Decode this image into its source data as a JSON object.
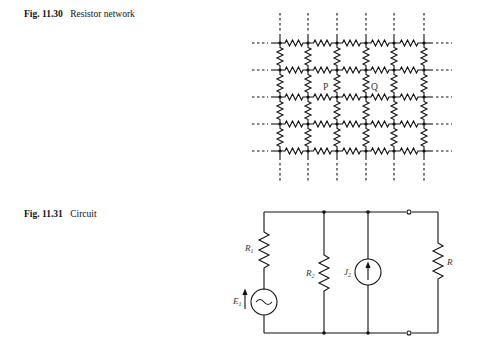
{
  "figures": [
    {
      "number": "Fig. 11.30",
      "title": "Resistor network",
      "labels": {
        "p": "P",
        "q": "Q"
      },
      "grid": {
        "columns_x": [
          280,
          308,
          337,
          366,
          394,
          424
        ],
        "rows_y": [
          43,
          70,
          97,
          124,
          151
        ]
      }
    },
    {
      "number": "Fig. 11.31",
      "title": "Circuit",
      "labels": {
        "r1": "R",
        "r1_sub": "1",
        "r2": "R",
        "r2_sub": "2",
        "j2": "J",
        "j2_sub": "2",
        "e1": "E",
        "e1_sub": "1",
        "r": "R"
      }
    }
  ],
  "colors": {
    "ink": "#111111",
    "label": "#333333",
    "background": "#ffffff"
  }
}
